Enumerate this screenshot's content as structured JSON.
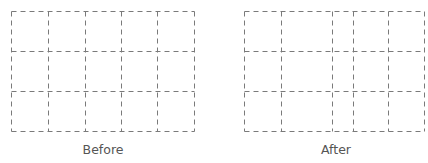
{
  "diagram": {
    "line_color": "#7a7a7a",
    "dash": "5,4",
    "panels": [
      {
        "label": "Before",
        "columns_x": [
          11,
          48,
          85,
          121,
          157,
          194
        ],
        "rows_y": [
          11,
          51,
          91,
          131
        ],
        "label_x": 103
      },
      {
        "label": "After",
        "columns_x": [
          244,
          281,
          332,
          353,
          388,
          424
        ],
        "rows_y": [
          11,
          51,
          91,
          131
        ],
        "label_x": 336
      }
    ]
  }
}
